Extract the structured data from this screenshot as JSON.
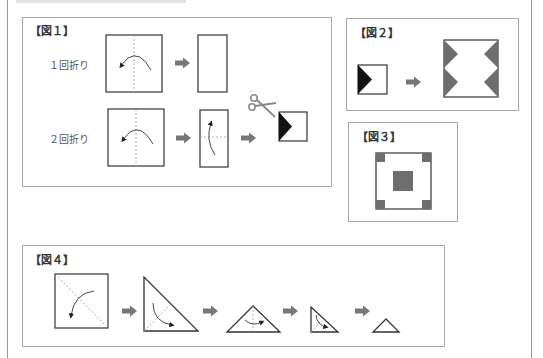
{
  "figures": {
    "fig1": {
      "label": "【図１】",
      "rows": [
        {
          "label": "１回折り",
          "steps": [
            "square-with-vertical-fold",
            "half-rectangle"
          ]
        },
        {
          "label": "２回折り",
          "steps": [
            "square-with-vertical-fold",
            "rectangle-with-horizontal-fold",
            "scissors-cut",
            "square-with-black-triangle"
          ]
        }
      ]
    },
    "fig2": {
      "label": "【図２】",
      "steps": [
        "square-with-black-triangle",
        "unfolded-square-with-four-gray-triangles"
      ]
    },
    "fig3": {
      "label": "【図３】",
      "description": "square with four gray corner squares and one gray center square"
    },
    "fig4": {
      "label": "【図４】",
      "steps": [
        "square-with-diagonal-fold",
        "right-triangle",
        "isosceles-triangle",
        "small-right-triangle",
        "small-triangle"
      ]
    }
  },
  "colors": {
    "line": "#333333",
    "fold_line": "#999999",
    "arrow": "#777777",
    "black_fill": "#111111",
    "gray_fill": "#6e6e6e",
    "box_border": "#a8a8a8"
  }
}
